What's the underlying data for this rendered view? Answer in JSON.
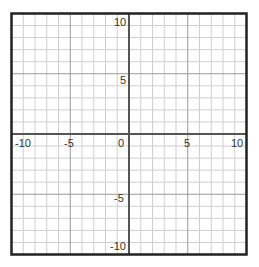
{
  "chart_data": {
    "type": "scatter",
    "title": "",
    "xlabel": "",
    "ylabel": "",
    "xlim": [
      -10,
      10
    ],
    "ylim": [
      -10,
      10
    ],
    "grid": true,
    "grid_step": 1,
    "major_grid_step": 5,
    "x_tick_labels": [
      "-10",
      "-5",
      "0",
      "5",
      "10"
    ],
    "y_tick_labels": [
      "10",
      "5",
      "-5",
      "-10"
    ],
    "series": []
  },
  "colors": {
    "frame": "#222222",
    "axis": "#555555",
    "major_grid": "#9a9a9a",
    "minor_grid": "#cfcfcf",
    "label": "#333333"
  },
  "labels": {
    "x_neg10": "-10",
    "x_neg5": "-5",
    "x_0": "0",
    "x_5": "5",
    "x_10": "10",
    "y_10": "10",
    "y_5": "5",
    "y_neg5": "-5",
    "y_neg10": "-10"
  }
}
